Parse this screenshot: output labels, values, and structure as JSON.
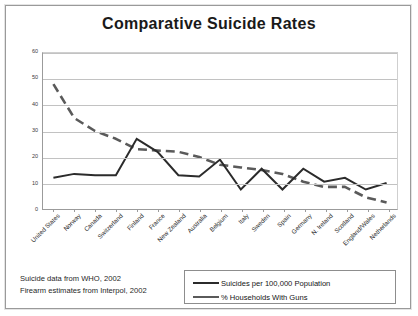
{
  "chart_data": {
    "type": "line",
    "title": "Comparative Suicide Rates",
    "xlabel": "",
    "ylabel": "",
    "ylim": [
      0,
      60
    ],
    "yticks": [
      0,
      10,
      20,
      30,
      40,
      50,
      60
    ],
    "grid": true,
    "legend_position": "bottom-right",
    "categories": [
      "United States",
      "Norway",
      "Canada",
      "Switzerland",
      "Finland",
      "France",
      "New Zealand",
      "Australia",
      "Belgium",
      "Italy",
      "Sweden",
      "Spain",
      "Germany",
      "N. Ireland",
      "Scotland",
      "England/Wales",
      "Netherlands"
    ],
    "series": [
      {
        "name": "Suicides per 100,000 Population",
        "style": "solid",
        "color": "#2b2b2b",
        "values": [
          12,
          13.5,
          13,
          13,
          27,
          22,
          13,
          12.5,
          19,
          7.5,
          15.5,
          7.5,
          15.5,
          10.5,
          12,
          7.5,
          10
        ]
      },
      {
        "name": "% Households With Guns",
        "style": "dashed",
        "color": "#5a5a5a",
        "values": [
          48,
          35,
          30,
          27,
          23,
          22.5,
          22,
          20,
          17,
          16,
          15,
          13.5,
          10.5,
          8.5,
          8.5,
          4.5,
          2.5
        ]
      }
    ],
    "annotations": [
      "Suicide data from WHO, 2002",
      "Firearm estimates from Interpol, 2002"
    ]
  },
  "footnote": {
    "line1": "Suicide data from WHO, 2002",
    "line2": "Firearm estimates from Interpol, 2002"
  },
  "legend": {
    "item1": "Suicides per 100,000 Population",
    "item2": "% Households With Guns"
  }
}
